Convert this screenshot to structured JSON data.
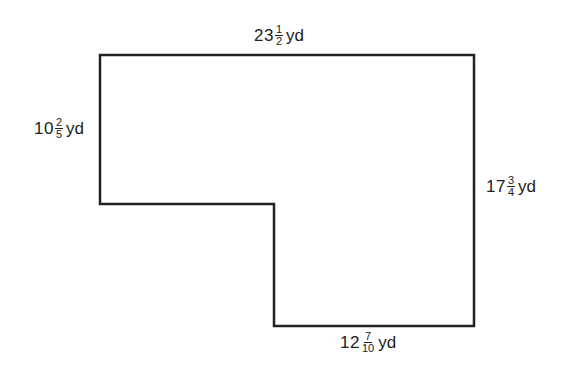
{
  "diagram": {
    "type": "L-shaped polygon (rectilinear floor plan)",
    "stroke_color": "#222222",
    "vertices": [
      [
        100,
        55
      ],
      [
        474,
        55
      ],
      [
        474,
        326
      ],
      [
        274,
        326
      ],
      [
        274,
        204
      ],
      [
        100,
        204
      ]
    ],
    "labels": {
      "top": {
        "whole": "23",
        "num": "1",
        "den": "2",
        "unit": "yd"
      },
      "left": {
        "whole": "10",
        "num": "2",
        "den": "5",
        "unit": "yd"
      },
      "right": {
        "whole": "17",
        "num": "3",
        "den": "4",
        "unit": "yd"
      },
      "bottom": {
        "whole": "12",
        "num": "7",
        "den": "10",
        "unit": "yd"
      }
    }
  }
}
